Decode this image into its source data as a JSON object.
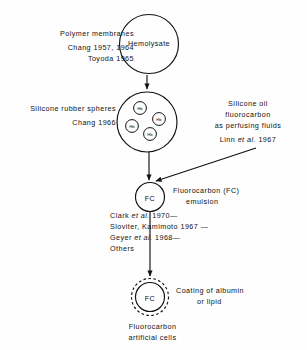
{
  "diagram": {
    "nodes": {
      "hemolysate": {
        "label": "Hemolysate",
        "shape": "circle"
      },
      "silicone_spheres": {
        "label": "",
        "shape": "circle",
        "inclusions": [
          "Hb",
          "Hb",
          "Hb",
          "Hb"
        ]
      },
      "fc_emulsion": {
        "label": "FC",
        "shape": "circle"
      },
      "fc_artificial_cell": {
        "label": "FC",
        "shape": "dashed-ring-circle"
      }
    },
    "left_annotations": [
      {
        "heading": "Polymer membranes",
        "citations": [
          "Chang 1957, 1964",
          "Toyoda 1965"
        ]
      },
      {
        "heading": "Silicone rubber spheres",
        "citations": [
          "Chang 1966"
        ]
      }
    ],
    "right_annotations": [
      {
        "lines": [
          "Silicone oil",
          "fluorocarbon",
          "as perfusing fluids"
        ],
        "citation_prefix": "Linn ",
        "citation_italic": "et al.",
        "citation_suffix": " 1967"
      },
      {
        "lines": [
          "Fluorocarbon (FC)",
          "emulsion"
        ]
      },
      {
        "lines": [
          "Coating of albumin",
          "or lipid"
        ]
      }
    ],
    "fc_citations": [
      {
        "prefix": "Clark ",
        "italic": "et al.",
        "suffix": " 1970—"
      },
      {
        "prefix": "Sloviter, Kamimoto 1967 —",
        "italic": "",
        "suffix": ""
      },
      {
        "prefix": "Geyer ",
        "italic": "et al.",
        "suffix": " 1968—"
      },
      {
        "prefix": "Others",
        "italic": "",
        "suffix": ""
      }
    ],
    "bottom_caption": [
      "Fluorocarbon",
      "artificial cells"
    ],
    "colors": {
      "ink": "#111111",
      "background": "#fefefe"
    }
  }
}
